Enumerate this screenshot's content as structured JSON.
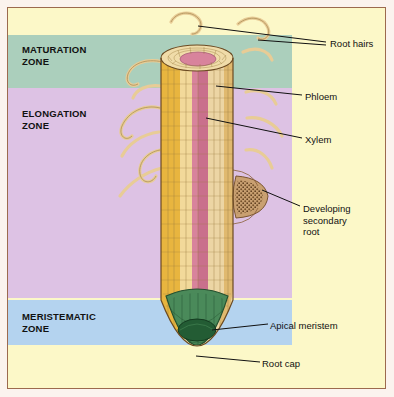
{
  "figure": {
    "background_color": "#fcf8c8",
    "frame_color": "#9c6a4e"
  },
  "zones": [
    {
      "id": "maturation",
      "label": "MATURATION\nZONE",
      "color": "#abcfbc"
    },
    {
      "id": "elongation",
      "label": "ELONGATION\nZONE",
      "color": "#ddc2e4"
    },
    {
      "id": "meristematic",
      "label": "MERISTEMATIC\nZONE",
      "color": "#b4d3ef"
    }
  ],
  "callouts": [
    {
      "id": "root-hairs",
      "label": "Root hairs"
    },
    {
      "id": "phloem",
      "label": "Phloem"
    },
    {
      "id": "xylem",
      "label": "Xylem"
    },
    {
      "id": "developing-secondary-root",
      "label": "Developing\nsecondary\nroot"
    },
    {
      "id": "apical-meristem",
      "label": "Apical meristem"
    },
    {
      "id": "root-cap",
      "label": "Root cap"
    }
  ],
  "anatomy": {
    "epidermis_color": "#e8b53f",
    "cortex_color": "#f5e3b4",
    "phloem_color": "#d8839c",
    "xylem_color": "#e8cfa0",
    "root_cap_color": "#3f7d4e",
    "apical_meristem_color": "#235c34",
    "secondary_root_color": "#8a6038",
    "root_hair_color": "#e3c893",
    "outline_color": "#6b4a22"
  }
}
